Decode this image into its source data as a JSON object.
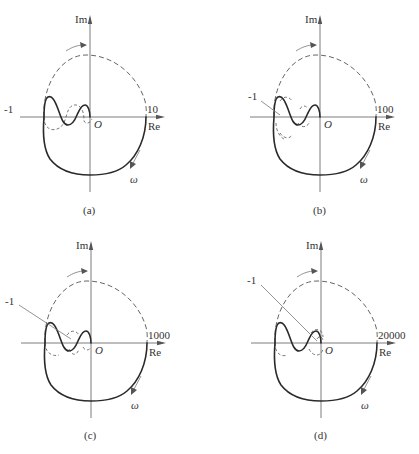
{
  "figure": {
    "panels": [
      {
        "id": "a",
        "caption": "(a)",
        "gain_label": "10",
        "minus_one_label": "-1",
        "minus_one_style": "inline",
        "axis_x_label": "Re",
        "axis_y_label": "Im",
        "origin_label": "O",
        "omega_label": "ω"
      },
      {
        "id": "b",
        "caption": "(b)",
        "gain_label": "100",
        "minus_one_label": "-1",
        "minus_one_style": "leader",
        "axis_x_label": "Re",
        "axis_y_label": "Im",
        "origin_label": "O",
        "omega_label": "ω"
      },
      {
        "id": "c",
        "caption": "(c)",
        "gain_label": "1000",
        "minus_one_label": "-1",
        "minus_one_style": "leader",
        "axis_x_label": "Re",
        "axis_y_label": "Im",
        "origin_label": "O",
        "omega_label": "ω"
      },
      {
        "id": "d",
        "caption": "(d)",
        "gain_label": "20000",
        "minus_one_label": "-1",
        "minus_one_style": "leader",
        "axis_x_label": "Re",
        "axis_y_label": "Im",
        "origin_label": "O",
        "omega_label": "ω"
      }
    ]
  }
}
